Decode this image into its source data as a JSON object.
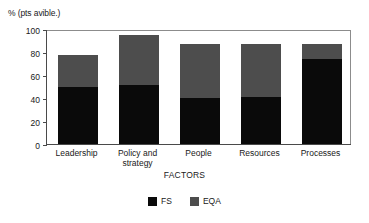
{
  "chart_data": {
    "type": "bar",
    "stacked": true,
    "title": "",
    "subtitle": "",
    "xlabel": "FACTORS",
    "ylabel": "% (pts avible.)",
    "categories": [
      "Leadership",
      "Policy and strategy",
      "People",
      "Resources",
      "Processes"
    ],
    "series": [
      {
        "name": "FS",
        "values": [
          50,
          51,
          40,
          41,
          74
        ],
        "color": "#0a0a0a"
      },
      {
        "name": "EQA",
        "values": [
          27,
          44,
          47,
          46,
          13
        ],
        "color": "#4d4d4d"
      }
    ],
    "totals": [
      77,
      95,
      87,
      87,
      87
    ],
    "ylim": [
      0,
      100
    ],
    "yticks": [
      0,
      20,
      40,
      60,
      80,
      100
    ],
    "ytick_labels": [
      "0",
      "20",
      "40",
      "60",
      "80",
      "100"
    ],
    "grid": false,
    "legend_position": "bottom"
  },
  "axes": {
    "y_title": "% (pts avible.)",
    "x_title": "FACTORS",
    "y_ticks": [
      "100",
      "80",
      "60",
      "40",
      "20",
      "0"
    ]
  },
  "category_labels": [
    {
      "line1": "Leadership",
      "line2": ""
    },
    {
      "line1": "Policy and",
      "line2": "strategy"
    },
    {
      "line1": "People",
      "line2": ""
    },
    {
      "line1": "Resources",
      "line2": ""
    },
    {
      "line1": "Processes",
      "line2": ""
    }
  ],
  "legend": {
    "items": [
      {
        "label": "FS",
        "color": "#0a0a0a"
      },
      {
        "label": "EQA",
        "color": "#4d4d4d"
      }
    ]
  }
}
